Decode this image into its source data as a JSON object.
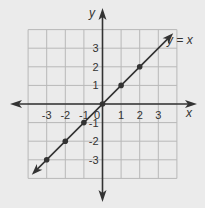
{
  "chart_data": {
    "type": "line",
    "title": "",
    "xlabel": "x",
    "ylabel": "y",
    "xlim": [
      -4,
      4
    ],
    "ylim": [
      -4,
      4
    ],
    "grid": true,
    "x_ticks": [
      -3,
      -2,
      -1,
      1,
      2,
      3
    ],
    "y_ticks": [
      -3,
      -2,
      -1,
      1,
      2,
      3
    ],
    "x_tick_labels": [
      "-3",
      "-2",
      "-1",
      "1",
      "2",
      "3"
    ],
    "y_tick_labels": [
      "-3",
      "-2",
      "-1",
      "1",
      "2",
      "3"
    ],
    "origin_label": "0",
    "series": [
      {
        "name": "y = x",
        "equation": "y = x",
        "line_range": [
          -3.8,
          3.8
        ],
        "points": [
          [
            -3,
            -3
          ],
          [
            -2,
            -2
          ],
          [
            -1,
            -1
          ],
          [
            0,
            0
          ],
          [
            1,
            1
          ],
          [
            2,
            2
          ]
        ]
      }
    ],
    "annotation": "y = x",
    "colors": {
      "background": "#ebebeb",
      "grid": "#b8b8b8",
      "ink": "#333333"
    }
  }
}
